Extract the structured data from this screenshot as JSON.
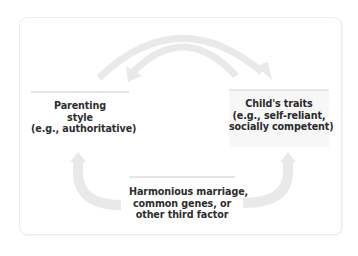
{
  "diagram": {
    "type": "causal-relationship",
    "nodes": {
      "parenting": {
        "lines": [
          "Parenting",
          "style",
          "(e.g., authoritative)"
        ]
      },
      "child": {
        "lines": [
          "Child's traits",
          "(e.g., self-reliant,",
          "socially competent)"
        ]
      },
      "third_factor": {
        "lines": [
          "Harmonious marriage,",
          "common genes, or",
          "other third factor"
        ]
      }
    },
    "edges": [
      {
        "from": "parenting",
        "to": "child",
        "style": "outer-arc-arrow"
      },
      {
        "from": "child",
        "to": "parenting",
        "style": "inner-arc-arrow"
      },
      {
        "from": "third_factor",
        "to": "parenting",
        "style": "curved-arrow-up-left"
      },
      {
        "from": "third_factor",
        "to": "child",
        "style": "curved-arrow-up-right"
      }
    ],
    "colors": {
      "arrow": "#e9e9e9",
      "frame_border": "#ececec",
      "node_bar": "#e6e6e6",
      "child_node_bg": "#f7f7f7",
      "text": "#2a2a2a"
    }
  }
}
